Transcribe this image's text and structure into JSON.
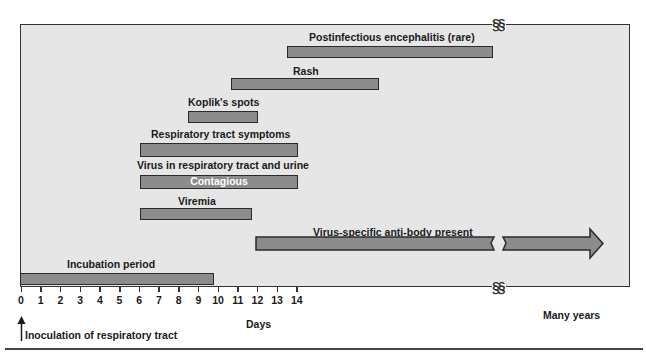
{
  "figure": {
    "x_axis": {
      "ticks": [
        "0",
        "1",
        "2",
        "3",
        "4",
        "5",
        "6",
        "7",
        "8",
        "9",
        "10",
        "11",
        "12",
        "13",
        "14"
      ],
      "title": "Days",
      "far_label": "Many years",
      "break_symbol": "§§"
    },
    "annotation": "Inoculation of respiratory tract",
    "bars": [
      {
        "id": "encephalitis",
        "label": "Postinfectious encephalitis (rare)",
        "start_day": 13.3,
        "end": "many years"
      },
      {
        "id": "rash",
        "label": "Rash",
        "start_day": 10.5,
        "end_day": 17.5
      },
      {
        "id": "koplik",
        "label": "Koplik's spots",
        "start_day": 8.4,
        "end_day": 11.9
      },
      {
        "id": "respiratory",
        "label": "Respiratory tract symptoms",
        "start_day": 6,
        "end_day": 14
      },
      {
        "id": "virus",
        "label": "Virus in respiratory tract and urine",
        "inner_label": "Contagious",
        "start_day": 6,
        "end_day": 14
      },
      {
        "id": "viremia",
        "label": "Viremia",
        "start_day": 6,
        "end_day": 11.6
      },
      {
        "id": "antibody",
        "label": "Virus-specific anti-body present",
        "start_day": 11.8,
        "end": "many years (arrow)"
      },
      {
        "id": "incubation",
        "label": "Incubation period",
        "start_day": 0,
        "end_day": 9.7
      }
    ],
    "colors": {
      "bar": "#8c8c8c",
      "background": "#e6e6e6",
      "border": "#2a2a2a"
    }
  }
}
